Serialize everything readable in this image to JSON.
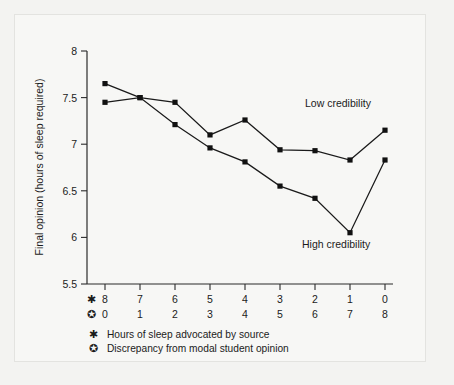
{
  "chart_data": {
    "type": "line",
    "title": "",
    "xlabel": "",
    "ylabel": "Final opinion (hours of sleep required)",
    "ylim": [
      5.5,
      8.0
    ],
    "yticks": [
      "5.5",
      "6",
      "6.5",
      "7",
      "7.5",
      "8"
    ],
    "ytick_values": [
      5.5,
      6,
      6.5,
      7,
      7.5,
      8
    ],
    "grid": false,
    "legend_position": "inline-annotation",
    "x_axis_rows": [
      {
        "glyph": "✱",
        "glyph_name": "asterisk-marker",
        "description": "Hours of sleep advocated by source",
        "values": [
          "8",
          "7",
          "6",
          "5",
          "4",
          "3",
          "2",
          "1",
          "0"
        ]
      },
      {
        "glyph": "✪",
        "glyph_name": "circled-star-marker",
        "description": "Discrepancy from modal student opinion",
        "values": [
          "0",
          "1",
          "2",
          "3",
          "4",
          "5",
          "6",
          "7",
          "8"
        ]
      }
    ],
    "categories": [
      "8",
      "7",
      "6",
      "5",
      "4",
      "3",
      "2",
      "1",
      "0"
    ],
    "series": [
      {
        "name": "Low credibility",
        "label": "Low credibility",
        "values": [
          7.45,
          7.5,
          7.45,
          7.1,
          7.26,
          6.94,
          6.93,
          6.83,
          7.15
        ]
      },
      {
        "name": "High credibility",
        "label": "High credibility",
        "values": [
          7.65,
          7.5,
          7.21,
          6.96,
          6.81,
          6.55,
          6.42,
          6.05,
          6.83
        ]
      }
    ],
    "annotations": [
      {
        "text": "Low credibility",
        "x_category": "1",
        "y": 7.32
      },
      {
        "text": "High credibility",
        "x_category": "1",
        "y": 6.0
      }
    ],
    "colors": {
      "line": "#1a1a1a",
      "marker": "#111111",
      "axis": "#2b2b2b",
      "background": "#f7f7f5",
      "page_background": "#f3f3f1"
    }
  }
}
